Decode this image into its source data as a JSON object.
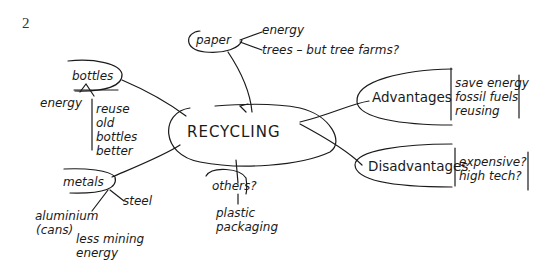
{
  "page_number": "2",
  "center": {
    "label": "RECYCLING"
  },
  "branches": {
    "paper": {
      "label": "paper",
      "items": [
        "energy",
        "trees – but tree farms?"
      ]
    },
    "bottles": {
      "label": "bottles",
      "left_item": "energy",
      "list": [
        "reuse",
        "old",
        "bottles",
        "better"
      ]
    },
    "metals": {
      "label": "metals",
      "items": [
        "steel",
        "aluminium",
        "(cans)"
      ],
      "note": [
        "less mining",
        "energy"
      ]
    },
    "others": {
      "label": "others?",
      "items": [
        "plastic",
        "packaging"
      ]
    },
    "advantages": {
      "label": "Advantages",
      "list": [
        "save energy",
        "fossil fuels",
        "reusing"
      ]
    },
    "disadvantages": {
      "label": "Disadvantages",
      "list": [
        "expensive?",
        "high tech?"
      ]
    }
  }
}
